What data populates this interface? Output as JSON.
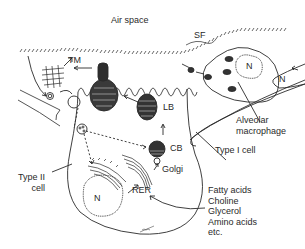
{
  "diagram": {
    "labels": {
      "air_space": "Air space",
      "sf": "SF",
      "tm": "TM",
      "lb": "LB",
      "cb": "CB",
      "golgi": "Golgi",
      "rer": "RER",
      "type2_nucleus": "N",
      "macrophage_nucleus": "N",
      "type1_nucleus": "N",
      "alveolar_macrophage": "Alveolar\nmacrophage",
      "type1_cell": "Type I cell",
      "type2_cell": "Type II\ncell",
      "precursors": "Fatty acids\nCholine\nGlycerol\nAmino acids\netc."
    },
    "precursor_list": [
      "Fatty acids",
      "Choline",
      "Glycerol",
      "Amino acids",
      "etc."
    ],
    "colors": {
      "line": "#2a2a2a",
      "organelle_dark": "#333333",
      "background": "#ffffff"
    }
  }
}
